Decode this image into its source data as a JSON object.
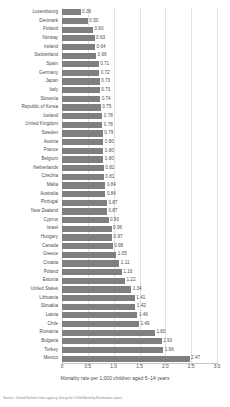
{
  "chart_data": {
    "type": "bar",
    "orientation": "horizontal",
    "title": "",
    "xlabel": "Mortality rate per 1,000 children aged 5–14 years",
    "ylabel": "",
    "xlim": [
      0,
      3.0
    ],
    "xticks": [
      0,
      0.5,
      1.0,
      1.5,
      2.0,
      2.5,
      3.0
    ],
    "xtick_labels": [
      "0",
      "0.5",
      "1.0",
      "1.5",
      "2.0",
      "2.5",
      "3.0"
    ],
    "grid": true,
    "legend": null,
    "bar_color": "#7f7f7f",
    "categories": [
      "Luxembourg",
      "Denmark",
      "Finland",
      "Norway",
      "Ireland",
      "Switzerland",
      "Spain",
      "Germany",
      "Japan",
      "Italy",
      "Slovenia",
      "Republic of Korea",
      "Iceland",
      "United Kingdom",
      "Sweden",
      "Austria",
      "France",
      "Belgium",
      "Netherlands",
      "Czechia",
      "Malta",
      "Australia",
      "Portugal",
      "New Zealand",
      "Cyprus",
      "Israel",
      "Hungary",
      "Canada",
      "Greece",
      "Croatia",
      "Poland",
      "Estonia",
      "United States",
      "Lithuania",
      "Slovakia",
      "Latvia",
      "Chile",
      "Romania",
      "Bulgaria",
      "Turkey",
      "Mexico"
    ],
    "values": [
      0.36,
      0.5,
      0.6,
      0.63,
      0.64,
      0.66,
      0.71,
      0.72,
      0.73,
      0.73,
      0.74,
      0.75,
      0.78,
      0.78,
      0.79,
      0.8,
      0.8,
      0.8,
      0.81,
      0.81,
      0.84,
      0.84,
      0.87,
      0.87,
      0.9,
      0.96,
      0.97,
      0.98,
      1.05,
      1.11,
      1.16,
      1.22,
      1.34,
      1.41,
      1.42,
      1.46,
      1.49,
      1.8,
      1.93,
      1.96,
      2.47
    ],
    "value_labels": [
      "0.36",
      "0.50",
      "0.60",
      "0.63",
      "0.64",
      "0.66",
      "0.71",
      "0.72",
      "0.73",
      "0.73",
      "0.74",
      "0.75",
      "0.78",
      "0.78",
      "0.79",
      "0.80",
      "0.80",
      "0.80",
      "0.81",
      "0.81",
      "0.84",
      "0.84",
      "0.87",
      "0.87",
      "0.90",
      "0.96",
      "0.97",
      "0.98",
      "1.05",
      "1.11",
      "1.16",
      "1.22",
      "1.34",
      "1.41",
      "1.42",
      "1.46",
      "1.49",
      "1.80",
      "1.93",
      "1.96",
      "2.47"
    ]
  },
  "footer": {
    "source": "Source: United Nations Inter-agency Group for Child Mortality Estimation report"
  }
}
